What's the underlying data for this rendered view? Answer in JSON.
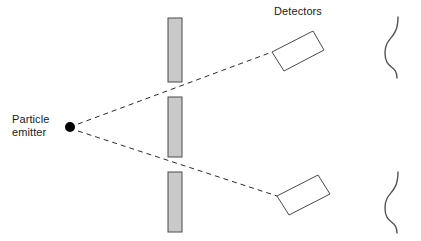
{
  "diagram": {
    "background_color": "#ffffff",
    "width": 421,
    "height": 241
  },
  "labels": {
    "emitter_line1": "Particle",
    "emitter_line2": "emitter",
    "detectors": "Detectors"
  },
  "colors": {
    "barrier_fill": "#c9c9c9",
    "barrier_stroke": "#4a4a4a",
    "detector_fill": "#ffffff",
    "detector_stroke": "#4a4a4a",
    "ray_stroke": "#2b2b2b",
    "wave_stroke": "#555555",
    "emitter_fill": "#000000",
    "text_fill": "#1a1a1a"
  },
  "emitter": {
    "name": "particle-emitter",
    "cx": 70,
    "cy": 127,
    "r": 5
  },
  "barriers": [
    {
      "name": "barrier-top",
      "x": 168,
      "y": 18,
      "width": 14,
      "height": 64
    },
    {
      "name": "barrier-middle",
      "x": 168,
      "y": 97,
      "width": 14,
      "height": 60
    },
    {
      "name": "barrier-bottom",
      "x": 168,
      "y": 172,
      "width": 14,
      "height": 60
    }
  ],
  "slits": [
    {
      "name": "slit-upper",
      "x": 175,
      "y": 89
    },
    {
      "name": "slit-lower",
      "x": 175,
      "y": 164
    }
  ],
  "rays": [
    {
      "name": "ray-upper",
      "x1": 78,
      "y1": 124,
      "x2": 272,
      "y2": 52
    },
    {
      "name": "ray-lower",
      "x1": 78,
      "y1": 131,
      "x2": 277,
      "y2": 196
    }
  ],
  "detectors": [
    {
      "name": "detector-upper",
      "points": "272,52 313,31 324,50 284,71",
      "rotation_deg": -27
    },
    {
      "name": "detector-lower",
      "points": "277,196 318,175 330,194 289,215",
      "rotation_deg": -27
    }
  ],
  "waves": [
    {
      "name": "wave-upper",
      "path": "M 398,17 C 398,40 385,36 385,53 C 385,70 397,64 397,78"
    },
    {
      "name": "wave-lower",
      "path": "M 398,172 C 398,195 385,191 385,208 C 385,225 397,219 397,233"
    }
  ],
  "text_positions": {
    "emitter_line1": {
      "x": 12,
      "y": 123
    },
    "emitter_line2": {
      "x": 12,
      "y": 136
    },
    "detectors": {
      "x": 274,
      "y": 15
    }
  }
}
